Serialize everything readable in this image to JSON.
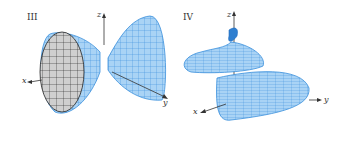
{
  "figure": {
    "panels": [
      {
        "id": "III",
        "label": "III",
        "surface": "hourglass (two-sheeted flared surface)",
        "axes": {
          "x": "x",
          "y": "y",
          "z": "z"
        }
      },
      {
        "id": "IV",
        "label": "IV",
        "surface": "helical tube",
        "axes": {
          "x": "x",
          "y": "y",
          "z": "z"
        }
      }
    ],
    "colors": {
      "surface_fill": "#a9d3f5",
      "mesh_line": "#3a8fdc",
      "inner_fill": "#cfcfcf",
      "inner_mesh": "#222222",
      "axis": "#333333"
    }
  }
}
